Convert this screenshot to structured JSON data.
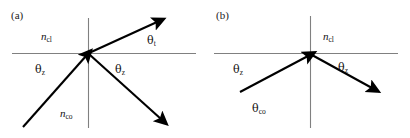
{
  "figure": {
    "background_color": "#ffffff",
    "axis_color": "#808080",
    "ray_color": "#000000",
    "text_color": "#111111"
  },
  "panels": [
    {
      "id": "a",
      "label": "(a)",
      "description": "refraction at cladding-core interface with transmitted ray",
      "media": {
        "upper": {
          "symbol": "n",
          "subscript": "cl"
        },
        "lower": {
          "symbol": "n",
          "subscript": "co"
        }
      },
      "angles": [
        {
          "name": "incident",
          "symbol": "θ",
          "subscript": "z"
        },
        {
          "name": "reflected",
          "symbol": "θ",
          "subscript": "z"
        },
        {
          "name": "transmitted",
          "symbol": "θ",
          "subscript": "t"
        }
      ]
    },
    {
      "id": "b",
      "label": "(b)",
      "description": "total internal reflection at critical angle",
      "media": {
        "upper": {
          "symbol": "n",
          "subscript": "cl"
        },
        "lower": {
          "symbol": "θ",
          "subscript": "co"
        }
      },
      "angles": [
        {
          "name": "incident",
          "symbol": "θ",
          "subscript": "z"
        },
        {
          "name": "reflected",
          "symbol": "θ",
          "subscript": "z"
        }
      ]
    }
  ],
  "labels": {
    "panel_a_tag": "(a)",
    "panel_a_ncl": {
      "sym": "n",
      "sub": "cl"
    },
    "panel_a_nco": {
      "sym": "n",
      "sub": "co"
    },
    "panel_a_theta_incident": {
      "sym": "θ",
      "sub": "z"
    },
    "panel_a_theta_reflected": {
      "sym": "θ",
      "sub": "z"
    },
    "panel_a_theta_transmitted": {
      "sym": "θ",
      "sub": "t"
    },
    "panel_b_tag": "(b)",
    "panel_b_ncl": {
      "sym": "n",
      "sub": "cl"
    },
    "panel_b_theta_co": {
      "sym": "θ",
      "sub": "co"
    },
    "panel_b_theta_incident": {
      "sym": "θ",
      "sub": "z"
    },
    "panel_b_theta_reflected": {
      "sym": "θ",
      "sub": "z"
    }
  }
}
